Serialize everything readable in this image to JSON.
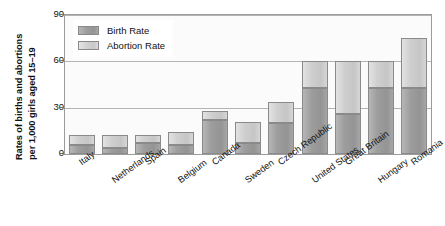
{
  "chart_data": {
    "type": "bar",
    "stacked": true,
    "title": "",
    "xlabel": "",
    "ylabel": "Rates of births and abortions per 1,000 girls aged 15–19",
    "ylabel_line1": "Rates of births and abortions",
    "ylabel_line2": "per 1,000 girls aged 15–19",
    "ylim": [
      0,
      90
    ],
    "yticks": [
      0,
      30,
      60,
      90
    ],
    "ytick_labels": [
      "0",
      "30",
      "60",
      "90"
    ],
    "grid": true,
    "legend_position": "top-left",
    "categories": [
      "Italy",
      "Netherlands",
      "Spain",
      "Belgium",
      "Canada",
      "Sweden",
      "Czech Republic",
      "United States",
      "Great Britain",
      "Hungary",
      "Romania"
    ],
    "series": [
      {
        "name": "Birth Rate",
        "color": "#9a9a9a",
        "values": [
          6,
          4,
          7,
          6,
          22,
          7,
          20,
          54,
          29,
          30,
          42
        ]
      },
      {
        "name": "Abortion Rate",
        "color": "#c8c8c8",
        "values": [
          6,
          8,
          5,
          8,
          21,
          17,
          12,
          29,
          46,
          36,
          34
        ]
      }
    ],
    "totals": [
      12,
      12,
      12,
      14,
      28,
      21,
      34,
      60,
      60,
      60,
      75
    ],
    "birth_values": [
      6,
      4,
      7,
      6,
      22,
      7,
      20,
      54,
      29,
      30,
      42
    ],
    "abortion_values": [
      6,
      8,
      5,
      8,
      6,
      14,
      14,
      6,
      31,
      30,
      33
    ],
    "bar_segments": [
      {
        "category": "Italy",
        "birth": 6,
        "total": 12
      },
      {
        "category": "Netherlands",
        "birth": 4,
        "total": 12
      },
      {
        "category": "Spain",
        "birth": 7,
        "total": 12
      },
      {
        "category": "Belgium",
        "birth": 6,
        "total": 14
      },
      {
        "category": "Canada",
        "birth": 22,
        "total": 28
      },
      {
        "category": "Sweden",
        "birth": 7,
        "total": 21
      },
      {
        "category": "Czech Republic",
        "birth": 20,
        "total": 34
      },
      {
        "category": "United States",
        "birth": 43,
        "total": 60
      },
      {
        "category": "Great Britain",
        "birth": 26,
        "total": 60
      },
      {
        "category": "Hungary",
        "birth": 43,
        "total": 60
      },
      {
        "category": "Romania",
        "birth": 43,
        "total": 75
      }
    ]
  },
  "legend": {
    "items": [
      {
        "label": "Birth Rate",
        "key": "birth"
      },
      {
        "label": "Abortion Rate",
        "key": "abortion"
      }
    ]
  },
  "colors": {
    "birth_rate": "#9a9a9a",
    "abortion_rate": "#c8c8c8",
    "grid": "#b4b4b4",
    "frame": "#9b9b9b",
    "plot_background": "#fbfbfb",
    "text": "#111111"
  }
}
